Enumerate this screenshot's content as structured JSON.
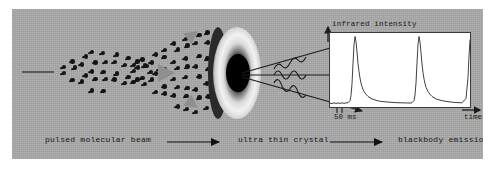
{
  "figure": {
    "background_color": "#a8a8a8",
    "panel_border_color": "#ffffff"
  },
  "scene": {
    "beam_label": "pulsed-molecular-beam",
    "crystal_label": "ultra-thin-crystal",
    "emission_label": "blackbody-emission"
  },
  "caption": {
    "stage1": "pulsed molecular beam",
    "stage2": "ultra thin crystal",
    "stage3": "blackbody emission",
    "arrow1": "arrow-right",
    "arrow2": "arrow-right"
  },
  "chart_data": {
    "type": "line",
    "title": "",
    "ylabel": "infrared intensity",
    "xlabel": "time",
    "tick_label": "50 ms",
    "grid": false,
    "legend": false,
    "xlim": [
      0,
      140
    ],
    "ylim": [
      0,
      1.05
    ],
    "annotations": [
      {
        "text": "50 ms",
        "x": 14,
        "note": "interval between the two tick marks on the time axis"
      }
    ],
    "series": [
      {
        "name": "infrared intensity",
        "x": [
          0,
          2,
          4,
          6,
          8,
          10,
          12,
          14,
          16,
          18,
          20,
          21,
          22,
          23,
          24,
          25,
          26,
          27,
          28,
          29,
          30,
          31,
          32,
          33,
          34,
          36,
          38,
          40,
          42,
          44,
          46,
          48,
          50,
          54,
          58,
          62,
          66,
          70,
          74,
          78,
          80,
          82,
          84,
          85,
          86,
          87,
          88,
          89,
          90,
          91,
          92,
          93,
          94,
          95,
          96,
          98,
          100,
          102,
          104,
          106,
          108,
          112,
          116,
          120,
          124,
          128,
          132,
          136,
          138,
          139,
          140
        ],
        "y": [
          0.055,
          0.048,
          0.06,
          0.05,
          0.058,
          0.05,
          0.06,
          0.052,
          0.058,
          0.06,
          0.09,
          0.16,
          0.33,
          0.62,
          0.88,
          1.0,
          0.93,
          0.78,
          0.62,
          0.5,
          0.41,
          0.34,
          0.29,
          0.25,
          0.22,
          0.18,
          0.15,
          0.13,
          0.115,
          0.105,
          0.095,
          0.088,
          0.082,
          0.075,
          0.07,
          0.066,
          0.062,
          0.06,
          0.058,
          0.057,
          0.056,
          0.06,
          0.09,
          0.17,
          0.34,
          0.63,
          0.89,
          1.0,
          0.92,
          0.77,
          0.61,
          0.49,
          0.4,
          0.33,
          0.28,
          0.22,
          0.18,
          0.15,
          0.13,
          0.115,
          0.105,
          0.09,
          0.08,
          0.072,
          0.066,
          0.062,
          0.06,
          0.12,
          0.42,
          0.72,
          0.95
        ]
      }
    ],
    "peaks": [
      {
        "index": 1,
        "x": 25,
        "y": 1.0
      },
      {
        "index": 2,
        "x": 89,
        "y": 1.0
      },
      {
        "index": 3,
        "x": 140,
        "y": 0.95,
        "note": "partial third peak at right edge"
      }
    ],
    "baseline": 0.055
  }
}
